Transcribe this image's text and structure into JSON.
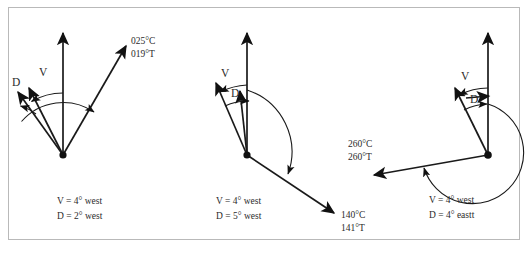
{
  "figure": {
    "border_color": "#b9b9b9",
    "ink_color": "#1a1a1a",
    "background": "#ffffff"
  },
  "diagrams": [
    {
      "id": "diagram-left",
      "label_v": "V",
      "label_d": "D",
      "bearing_lines": [
        "025°C",
        "019°T"
      ],
      "caption_lines": [
        "V = 4° west",
        "D = 2° west"
      ]
    },
    {
      "id": "diagram-middle",
      "label_v": "V",
      "label_d": "D",
      "bearing_lines": [
        "140°C",
        "141°T"
      ],
      "caption_lines": [
        "V = 4° west",
        "D = 5° west"
      ]
    },
    {
      "id": "diagram-right",
      "label_v": "V",
      "label_d": "D",
      "bearing_lines": [
        "260°C",
        "260°T"
      ],
      "caption_lines": [
        "V = 4° west",
        "D = 4° eastt"
      ]
    }
  ]
}
